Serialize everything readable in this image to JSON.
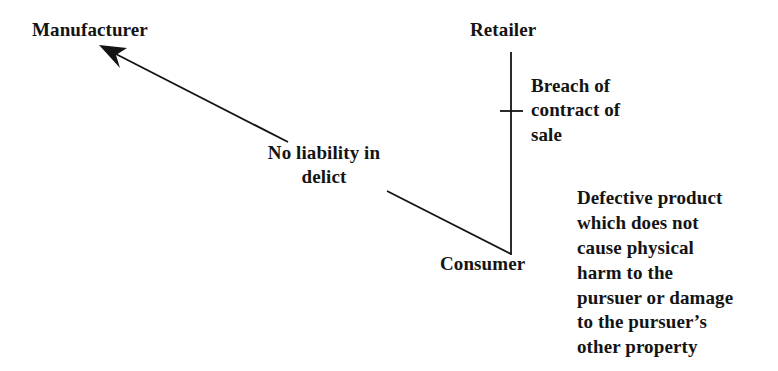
{
  "diagram": {
    "background_color": "#ffffff",
    "ink_color": "#141414",
    "nodes": [
      {
        "id": "manufacturer",
        "label": "Manufacturer"
      },
      {
        "id": "retailer",
        "label": "Retailer"
      },
      {
        "id": "consumer",
        "label": "Consumer"
      }
    ],
    "edges": {
      "consumer_to_manufacturer": {
        "label_line1": "No liability in",
        "label_line2": "delict",
        "arrowhead": "arrow-head-icon",
        "direction": "towards-manufacturer"
      },
      "retailer_to_consumer": {
        "label_line1": "Breach of",
        "label_line2": "contract of",
        "label_line3": "sale",
        "marker": "cross-hatch-icon",
        "direction": "vertical"
      }
    },
    "note": {
      "line1": "Defective product",
      "line2": "which does not",
      "line3": "cause physical",
      "line4": "harm to the",
      "line5": "pursuer or damage",
      "line6": "to the pursuer’s",
      "line7": "other property"
    }
  }
}
